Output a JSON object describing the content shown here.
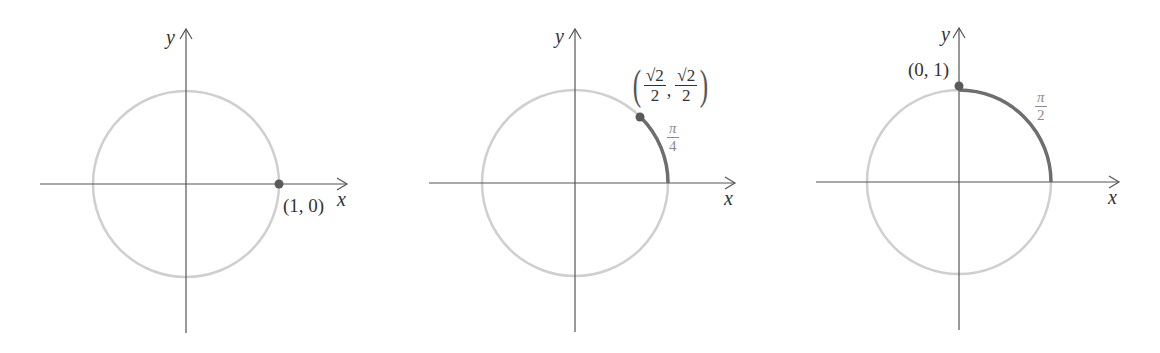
{
  "figure": {
    "colors": {
      "axis": "#555555",
      "circle": "#cfcfcf",
      "arc": "#6e6e6e",
      "point": "#5a5a5a",
      "angle_label": "#8a8a8a",
      "text": "#333333"
    },
    "panels": [
      {
        "x_label": "x",
        "y_label": "y",
        "point_label": "(1, 0)",
        "angle_label": null,
        "arc_angle": "0"
      },
      {
        "x_label": "x",
        "y_label": "y",
        "point_label": {
          "open": "(",
          "x_num": "√2",
          "x_den": "2",
          "sep": ",",
          "y_num": "√2",
          "y_den": "2",
          "close": ")"
        },
        "angle_label": {
          "num": "π",
          "den": "4"
        },
        "arc_angle": "π/4"
      },
      {
        "x_label": "x",
        "y_label": "y",
        "point_label": "(0, 1)",
        "angle_label": {
          "num": "π",
          "den": "2"
        },
        "arc_angle": "π/2"
      }
    ]
  }
}
